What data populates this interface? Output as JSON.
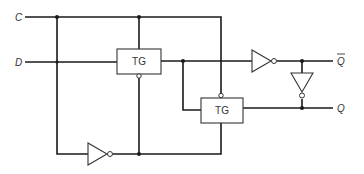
{
  "diagram": {
    "type": "logic-schematic",
    "inputs": [
      {
        "id": "C",
        "label": "C"
      },
      {
        "id": "D",
        "label": "D"
      }
    ],
    "outputs": [
      {
        "id": "Qbar",
        "label": "Q",
        "overbar": true
      },
      {
        "id": "Q",
        "label": "Q",
        "overbar": false
      }
    ],
    "gates": [
      {
        "id": "tg1",
        "type": "transmission-gate",
        "label": "TG"
      },
      {
        "id": "tg2",
        "type": "transmission-gate",
        "label": "TG"
      },
      {
        "id": "inv_clock",
        "type": "inverter"
      },
      {
        "id": "inv_forward",
        "type": "inverter"
      },
      {
        "id": "inv_feedback",
        "type": "inverter"
      }
    ],
    "colors": {
      "line": "#1a1a1a",
      "background": "#ffffff"
    }
  }
}
